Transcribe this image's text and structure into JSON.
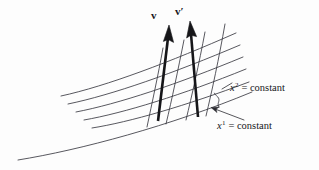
{
  "figure": {
    "background_color": "#fdfdfd",
    "ink_color": "#1a1a1f",
    "thin_line_color": "#3c3c44",
    "labels": {
      "vector_v": "v",
      "vector_v_prime_base": "v",
      "vector_v_prime_mark": "′",
      "x2_var": "x",
      "x2_sup": "2",
      "x2_eq": "=",
      "x2_word": "constant",
      "x1_var": "x",
      "x1_sup": "1",
      "x1_eq": "=",
      "x1_word": "constant"
    },
    "geometry": {
      "x1_family_label": "x1 = constant",
      "x2_family_label": "x2 = constant",
      "vector_count": 2,
      "x2_curve_count": 5,
      "x1_curve_count": 4,
      "baseline_present": true
    }
  }
}
